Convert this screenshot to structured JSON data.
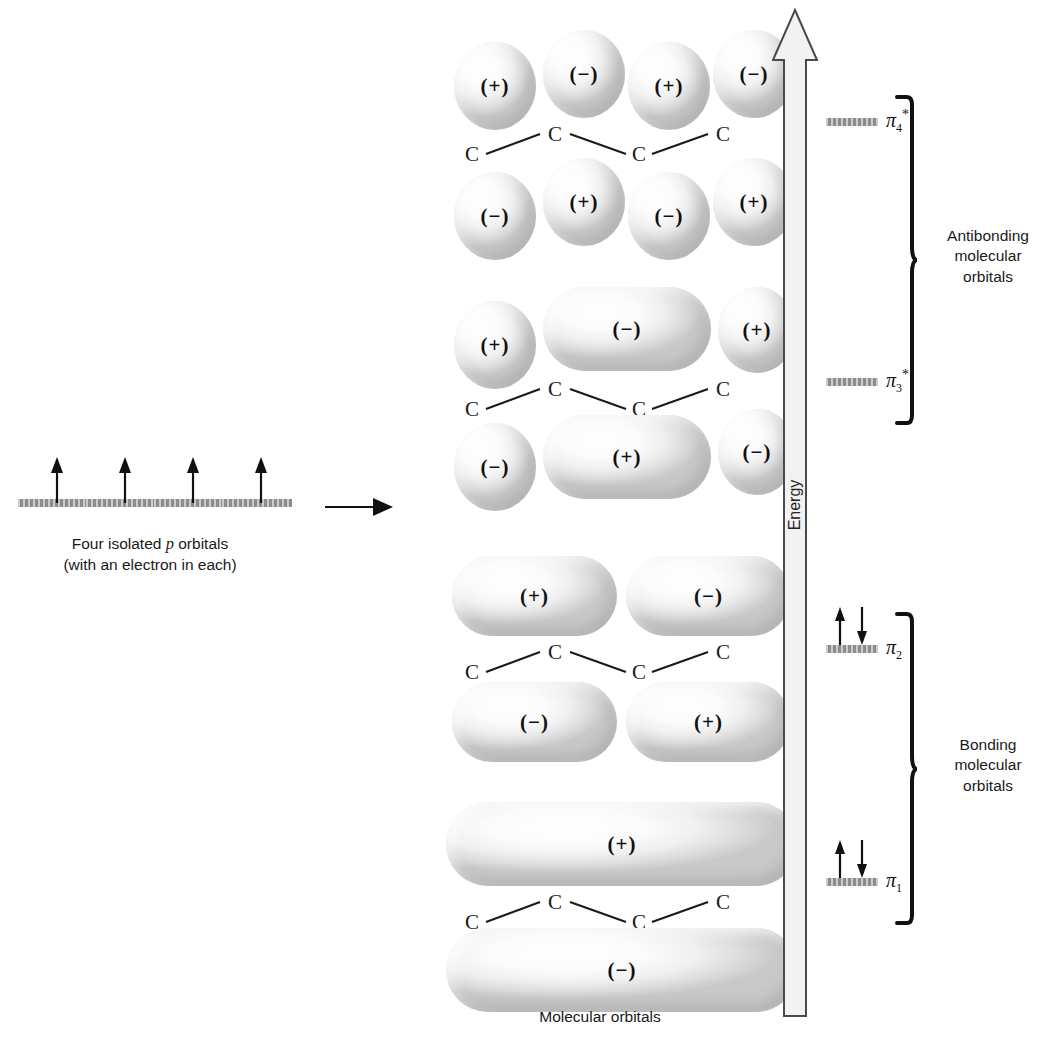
{
  "diagram": {
    "left_caption_line1": "Four isolated p orbitals",
    "left_caption_line1_plain": "Four isolated ",
    "left_caption_italic": "p",
    "left_caption_line1_tail": " orbitals",
    "left_caption_line2": "(with an electron in each)",
    "bottom_caption": "Molecular orbitals",
    "energy_axis_label": "Energy",
    "transition_arrow": "right-arrow-icon"
  },
  "isolated_orbitals": {
    "count": 4,
    "electrons_each": 1,
    "bars": [
      {
        "label": "p-orbital-1",
        "x": 18
      },
      {
        "label": "p-orbital-2",
        "x": 86
      },
      {
        "label": "p-orbital-3",
        "x": 154
      },
      {
        "label": "p-orbital-4",
        "x": 222
      }
    ]
  },
  "carbon_label": "C",
  "signs": {
    "plus": "(+)",
    "minus": "(−)"
  },
  "molecular_orbitals": [
    {
      "name": "pi-4-star",
      "symbol": "π",
      "subscript": "4",
      "superscript": "*",
      "type": "antibonding",
      "nodes": 3,
      "electrons": 0,
      "top_signs": [
        "(+)",
        "(−)",
        "(+)",
        "(−)"
      ],
      "bottom_signs": [
        "(−)",
        "(+)",
        "(−)",
        "(+)"
      ],
      "lobe_shape": "four-separate-spheres"
    },
    {
      "name": "pi-3-star",
      "symbol": "π",
      "subscript": "3",
      "superscript": "*",
      "type": "antibonding",
      "nodes": 2,
      "electrons": 0,
      "top_signs": [
        "(+)",
        "(−)",
        "(+)"
      ],
      "bottom_signs": [
        "(−)",
        "(+)",
        "(−)"
      ],
      "lobe_shape": "end-spheres-merged-center"
    },
    {
      "name": "pi-2",
      "symbol": "π",
      "subscript": "2",
      "superscript": "",
      "type": "bonding",
      "nodes": 1,
      "electrons": 2,
      "top_signs": [
        "(+)",
        "(−)"
      ],
      "bottom_signs": [
        "(−)",
        "(+)"
      ],
      "lobe_shape": "two-merged-pairs"
    },
    {
      "name": "pi-1",
      "symbol": "π",
      "subscript": "1",
      "superscript": "",
      "type": "bonding",
      "nodes": 0,
      "electrons": 2,
      "top_signs": [
        "(+)"
      ],
      "bottom_signs": [
        "(−)"
      ],
      "lobe_shape": "fully-delocalized"
    }
  ],
  "energy_levels": [
    {
      "name": "pi-4-star",
      "label_symbol": "π",
      "sub": "4",
      "sup": "*",
      "y": 118,
      "electrons": 0
    },
    {
      "name": "pi-3-star",
      "label_symbol": "π",
      "sub": "3",
      "sup": "*",
      "y": 378,
      "electrons": 0
    },
    {
      "name": "pi-2",
      "label_symbol": "π",
      "sub": "2",
      "sup": "",
      "y": 645,
      "electrons": 2
    },
    {
      "name": "pi-1",
      "label_symbol": "π",
      "sub": "1",
      "sup": "",
      "y": 878,
      "electrons": 2
    }
  ],
  "groups": [
    {
      "name": "antibonding",
      "line1": "Antibonding",
      "line2": "molecular",
      "line3": "orbitals",
      "top": 95,
      "height": 330
    },
    {
      "name": "bonding",
      "line1": "Bonding",
      "line2": "molecular",
      "line3": "orbitals",
      "top": 612,
      "height": 313
    }
  ],
  "colors": {
    "energy_bar": "#8c8c8c",
    "outline": "#3a3a3a",
    "text": "#1a1a1a",
    "lobe_light": "#ffffff",
    "lobe_shade": "#c9c9c9"
  }
}
